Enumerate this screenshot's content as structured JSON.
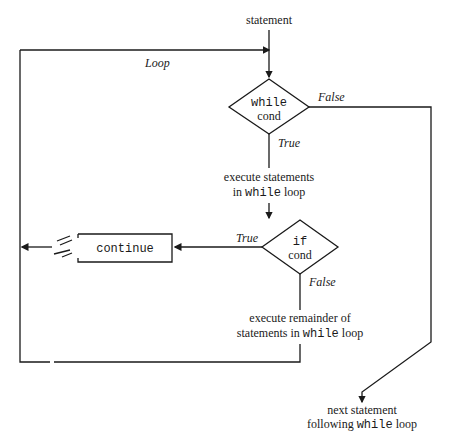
{
  "diagram": {
    "type": "flowchart",
    "nodes": {
      "start": "statement",
      "while_kw": "while",
      "while_cond": "cond",
      "body_line1": "execute statements",
      "body_line2_prefix": "in ",
      "body_line2_kw": "while",
      "body_line2_suffix": " loop",
      "if_kw": "if",
      "if_cond": "cond",
      "continue": "continue",
      "rem_line1": "execute remainder of",
      "rem_line2_prefix": "statements in ",
      "rem_line2_kw": "while",
      "rem_line2_suffix": " loop",
      "next_line1": "next statement",
      "next_line2_prefix": "following ",
      "next_line2_kw": "while",
      "next_line2_suffix": " loop"
    },
    "edge_labels": {
      "loop": "Loop",
      "while_false": "False",
      "while_true": "True",
      "if_true": "True",
      "if_false": "False"
    }
  }
}
